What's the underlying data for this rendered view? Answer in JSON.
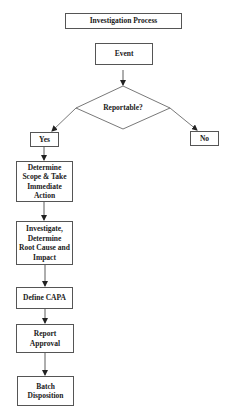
{
  "title": "Investigation Process",
  "nodes": {
    "event": "Event",
    "decision": "Reportable?",
    "yes": "Yes",
    "no": "No",
    "scope": "Determine Scope & Take Immediate Action",
    "investigate": "Investigate, Determine Root Cause and Impact",
    "capa": "Define CAPA",
    "approval": "Report Approval",
    "disposition": "Batch Disposition"
  },
  "colors": {
    "stroke": "#555555",
    "text": "#1a1a1a",
    "background": "#ffffff"
  }
}
